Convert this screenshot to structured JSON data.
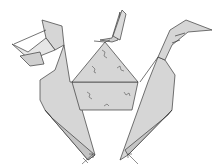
{
  "diagram": {
    "colors": {
      "paper": "#d6d6d6",
      "paper_shadow": "#c4c4c4",
      "line": "#3a3a3a",
      "background": "#ffffff"
    },
    "parts": [
      "left-head",
      "center-figure",
      "right-head",
      "center-panel",
      "left-leg",
      "right-leg"
    ],
    "annotations": [
      "fold-arrow-left",
      "fold-arrow-right"
    ]
  }
}
